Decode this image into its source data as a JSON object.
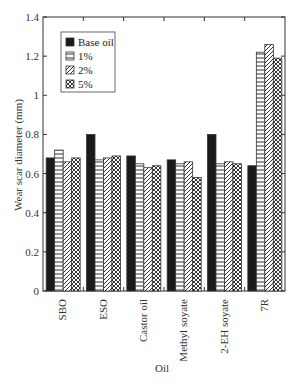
{
  "chart_data": {
    "type": "bar",
    "title": "",
    "xlabel": "Oil",
    "ylabel": "Wear scar diameter (mm)",
    "ylim": [
      0,
      1.4
    ],
    "yticks": [
      0,
      0.2,
      0.4,
      0.6,
      0.8,
      1,
      1.2,
      1.4
    ],
    "ytick_labels": [
      "0",
      "0.2",
      "0.4",
      "0.6",
      "0.8",
      "1",
      "1.2",
      "1.4"
    ],
    "grid": false,
    "legend_position": "upper left (inside)",
    "categories": [
      "SBO",
      "ESO",
      "Castor oil",
      "Methyl soyate",
      "2-EH soyate",
      "7R"
    ],
    "series": [
      {
        "name": "Base oil",
        "pattern": "solid-black",
        "values": [
          0.68,
          0.8,
          0.69,
          0.67,
          0.8,
          0.64
        ]
      },
      {
        "name": "1%",
        "pattern": "horizontal-lines",
        "values": [
          0.72,
          0.67,
          0.65,
          0.65,
          0.65,
          1.22
        ]
      },
      {
        "name": "2%",
        "pattern": "diagonal-lines",
        "values": [
          0.66,
          0.68,
          0.63,
          0.66,
          0.66,
          1.26
        ]
      },
      {
        "name": "5%",
        "pattern": "crosshatch",
        "values": [
          0.68,
          0.69,
          0.64,
          0.58,
          0.65,
          1.19
        ]
      }
    ]
  },
  "colors": {
    "axis": "#333333",
    "base_oil": "#1a1a1a",
    "pattern_stroke": "#333333",
    "background": "#ffffff"
  }
}
